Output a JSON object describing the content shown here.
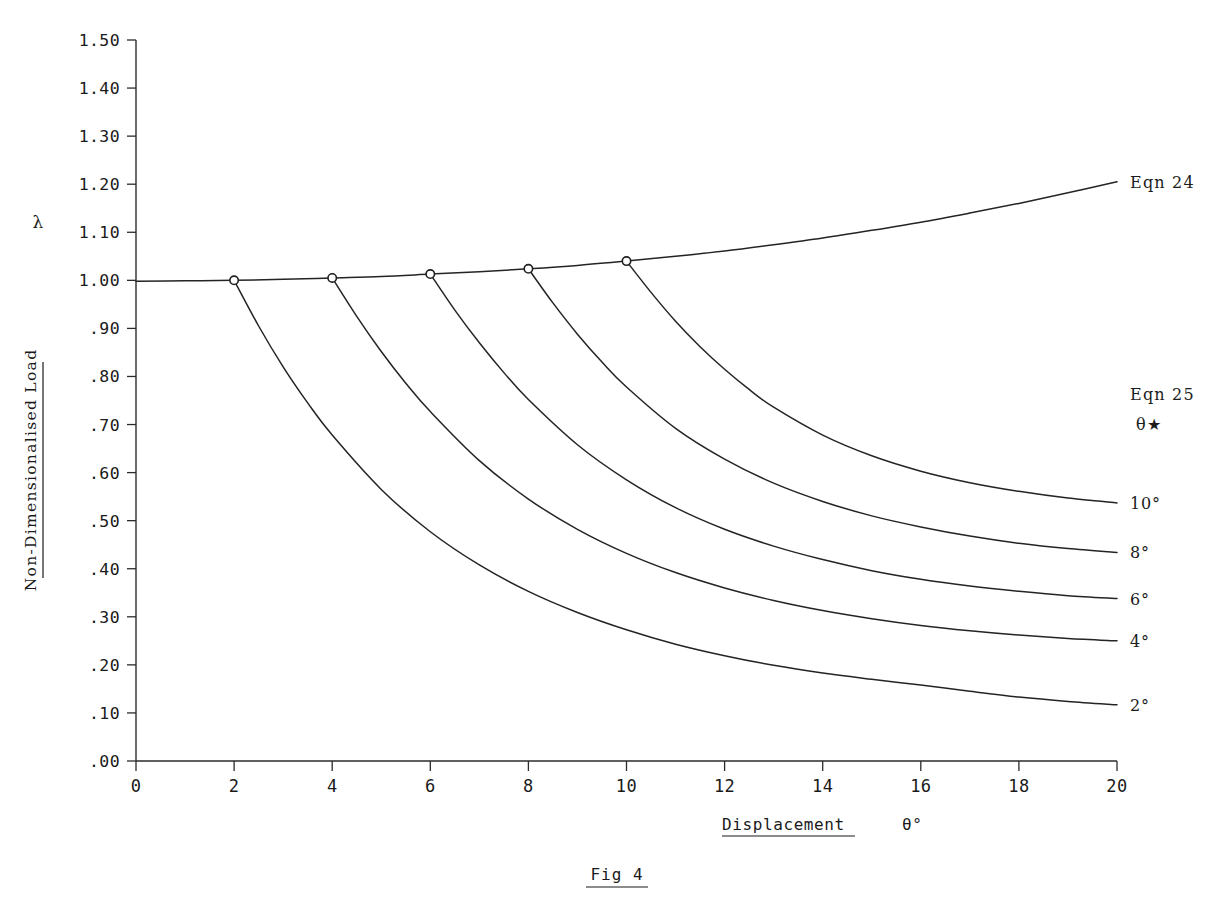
{
  "figure": {
    "caption": "Fig 4",
    "background": "#ffffff",
    "ink_color": "#242424"
  },
  "axes": {
    "y_axis_title_line1": "Non-Dimensionalised Load",
    "y_axis_symbol": "λ",
    "x_axis_title": "Displacement",
    "x_axis_symbol": "θ°",
    "y_ticks": [
      "1.50",
      "1.40",
      "1.30",
      "1.20",
      "1.10",
      "1.00",
      ".90",
      ".80",
      ".70",
      ".60",
      ".50",
      ".40",
      ".30",
      ".20",
      ".10",
      ".00"
    ],
    "y_tick_values": [
      1.5,
      1.4,
      1.3,
      1.2,
      1.1,
      1.0,
      0.9,
      0.8,
      0.7,
      0.6,
      0.5,
      0.4,
      0.3,
      0.2,
      0.1,
      0.0
    ],
    "x_ticks": [
      "0",
      "2",
      "4",
      "6",
      "8",
      "10",
      "12",
      "14",
      "16",
      "18",
      "20"
    ],
    "x_tick_values": [
      0,
      2,
      4,
      6,
      8,
      10,
      12,
      14,
      16,
      18,
      20
    ]
  },
  "annotations": {
    "eqn24_label": "Eqn 24",
    "eqn25_label": "Eqn 25",
    "theta_star_label": "θ★",
    "branch_labels": [
      "10°",
      "8°",
      "6°",
      "4°",
      "2°"
    ]
  },
  "chart_data": {
    "type": "line",
    "title": "Fig 4",
    "xlabel": "Displacement θ°",
    "ylabel": "Non-Dimensionalised Load λ",
    "xlim": [
      0,
      20
    ],
    "ylim": [
      0.0,
      1.5
    ],
    "grid": false,
    "legend_position": "right",
    "x_tick_step": 2,
    "y_tick_step": 0.1,
    "series": [
      {
        "name": "Eqn 24",
        "kind": "primary-equilibrium-path",
        "label_at_end": "Eqn 24",
        "x": [
          0,
          1,
          2,
          3,
          4,
          5,
          6,
          7,
          8,
          9,
          10,
          11,
          12,
          13,
          14,
          15,
          16,
          17,
          18,
          19,
          20
        ],
        "y": [
          0.998,
          0.999,
          1.0,
          1.002,
          1.005,
          1.008,
          1.013,
          1.018,
          1.024,
          1.031,
          1.04,
          1.05,
          1.061,
          1.074,
          1.088,
          1.104,
          1.121,
          1.14,
          1.16,
          1.182,
          1.205
        ]
      },
      {
        "name": "10°",
        "kind": "post-buckling-branch",
        "theta_star": 10,
        "branch_point": {
          "x": 10,
          "y": 1.04
        },
        "label_at_end": "10°",
        "x": [
          10,
          10.5,
          11,
          11.5,
          12,
          12.5,
          13,
          14,
          15,
          16,
          17,
          18,
          19,
          20
        ],
        "y": [
          1.04,
          0.975,
          0.915,
          0.862,
          0.815,
          0.773,
          0.736,
          0.678,
          0.635,
          0.603,
          0.579,
          0.561,
          0.547,
          0.537
        ]
      },
      {
        "name": "8°",
        "kind": "post-buckling-branch",
        "theta_star": 8,
        "branch_point": {
          "x": 8,
          "y": 1.024
        },
        "label_at_end": "8°",
        "x": [
          8,
          8.5,
          9,
          9.5,
          10,
          11,
          12,
          13,
          14,
          15,
          16,
          17,
          18,
          19,
          20
        ],
        "y": [
          1.024,
          0.953,
          0.888,
          0.83,
          0.778,
          0.692,
          0.628,
          0.578,
          0.54,
          0.51,
          0.487,
          0.468,
          0.453,
          0.442,
          0.434
        ]
      },
      {
        "name": "6°",
        "kind": "post-buckling-branch",
        "theta_star": 6,
        "branch_point": {
          "x": 6,
          "y": 1.013
        },
        "label_at_end": "6°",
        "x": [
          6,
          6.5,
          7,
          7.5,
          8,
          9,
          10,
          11,
          12,
          13,
          14,
          15,
          16,
          17,
          18,
          19,
          20
        ],
        "y": [
          1.013,
          0.938,
          0.87,
          0.808,
          0.752,
          0.658,
          0.585,
          0.527,
          0.482,
          0.447,
          0.419,
          0.396,
          0.378,
          0.364,
          0.353,
          0.344,
          0.338
        ]
      },
      {
        "name": "4°",
        "kind": "post-buckling-branch",
        "theta_star": 4,
        "branch_point": {
          "x": 4,
          "y": 1.005
        },
        "label_at_end": "4°",
        "x": [
          4,
          4.5,
          5,
          5.5,
          6,
          7,
          8,
          9,
          10,
          11,
          12,
          13,
          14,
          15,
          16,
          17,
          18,
          19,
          20
        ],
        "y": [
          1.005,
          0.925,
          0.852,
          0.786,
          0.727,
          0.625,
          0.545,
          0.482,
          0.432,
          0.392,
          0.36,
          0.334,
          0.313,
          0.296,
          0.282,
          0.271,
          0.262,
          0.255,
          0.25
        ]
      },
      {
        "name": "2°",
        "kind": "post-buckling-branch",
        "theta_star": 2,
        "branch_point": {
          "x": 2,
          "y": 1.0
        },
        "label_at_end": "2°",
        "x": [
          2,
          2.5,
          3,
          3.5,
          4,
          5,
          6,
          7,
          8,
          9,
          10,
          11,
          12,
          13,
          14,
          15,
          16,
          17,
          18,
          19,
          20
        ],
        "y": [
          1.0,
          0.905,
          0.82,
          0.745,
          0.678,
          0.565,
          0.477,
          0.408,
          0.353,
          0.309,
          0.273,
          0.243,
          0.219,
          0.199,
          0.183,
          0.17,
          0.158,
          0.145,
          0.133,
          0.124,
          0.117
        ]
      }
    ],
    "markers": [
      {
        "x": 2,
        "y": 1.0,
        "shape": "open-circle"
      },
      {
        "x": 4,
        "y": 1.005,
        "shape": "open-circle"
      },
      {
        "x": 6,
        "y": 1.013,
        "shape": "open-circle"
      },
      {
        "x": 8,
        "y": 1.024,
        "shape": "open-circle"
      },
      {
        "x": 10,
        "y": 1.04,
        "shape": "open-circle"
      }
    ]
  }
}
